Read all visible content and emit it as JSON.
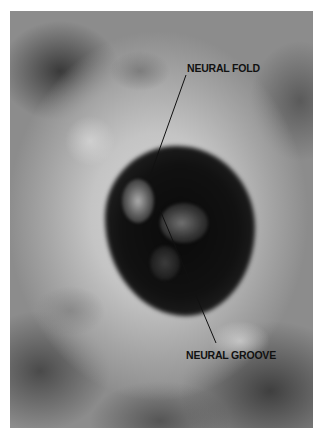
{
  "figure": {
    "type": "ultrasound-image",
    "colors": {
      "background": "#ffffff",
      "label_text": "#111111",
      "pointer_line": "#111111"
    },
    "labels": [
      {
        "text": "NEURAL FOLD",
        "anchor": "top-right"
      },
      {
        "text": "NEURAL GROOVE",
        "anchor": "bottom-right"
      }
    ]
  }
}
